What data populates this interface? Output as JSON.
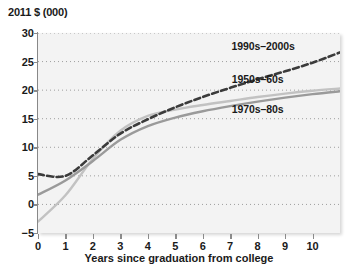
{
  "chart_data": {
    "type": "line",
    "title": "",
    "ylabel": "2011 $ (000)",
    "xlabel": "Years since graduation from college",
    "xlim": [
      0,
      11
    ],
    "ylim": [
      -5,
      30
    ],
    "xticks": [
      0,
      1,
      2,
      3,
      4,
      5,
      6,
      7,
      8,
      9,
      10
    ],
    "yticks": [
      -5,
      0,
      5,
      10,
      15,
      20,
      25,
      30
    ],
    "grid": "horizontal-dotted",
    "legend": "inline-labels",
    "x": [
      0,
      1,
      2,
      3,
      4,
      5,
      6,
      7,
      8,
      9,
      10,
      11
    ],
    "series": [
      {
        "name": "1990s–2000s",
        "style": "dashed",
        "color": "#3b3b3b",
        "values": [
          5.3,
          5.0,
          8.6,
          12.4,
          14.9,
          17.0,
          18.8,
          20.4,
          21.9,
          23.3,
          24.8,
          26.6
        ]
      },
      {
        "name": "1950s–60s",
        "style": "solid",
        "color": "#c2c2c2",
        "values": [
          -3.0,
          1.6,
          8.0,
          12.9,
          15.5,
          16.6,
          17.4,
          18.1,
          18.8,
          19.4,
          19.9,
          20.3
        ]
      },
      {
        "name": "1970s–80s",
        "style": "solid",
        "color": "#9a9a9a",
        "values": [
          1.7,
          4.2,
          7.6,
          11.3,
          13.7,
          15.2,
          16.3,
          17.2,
          18.0,
          18.7,
          19.3,
          19.8
        ]
      }
    ],
    "annotations": [
      {
        "text": "1990s–2000s",
        "x": 8.2,
        "y": 27.6
      },
      {
        "text": "1950s–60s",
        "x": 8.0,
        "y": 21.8
      },
      {
        "text": "1970s–80s",
        "x": 8.0,
        "y": 16.6
      }
    ]
  }
}
